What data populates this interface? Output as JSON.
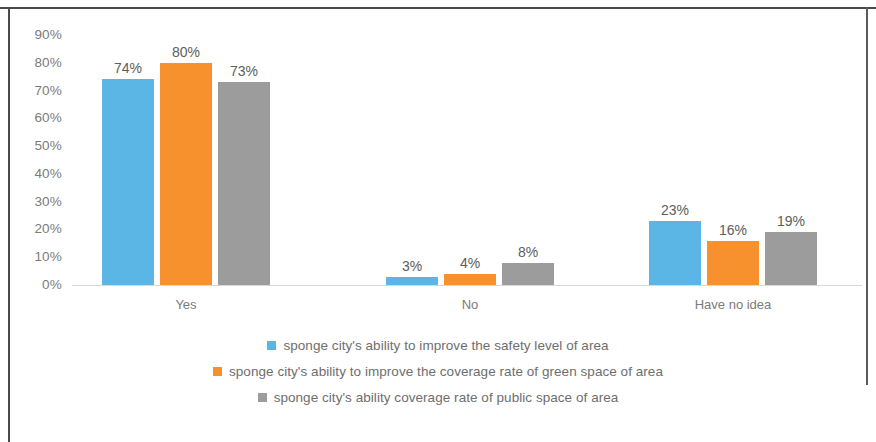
{
  "chart_data": {
    "type": "bar",
    "title": "",
    "subtitle": "",
    "xlabel": "",
    "ylabel": "",
    "categories": [
      "Yes",
      "No",
      "Have no idea"
    ],
    "series": [
      {
        "name": "sponge city's ability to improve the safety level of area",
        "color": "#5BB5E5",
        "values": [
          74,
          80,
          73
        ],
        "labels": [
          "74%",
          "3%",
          "23%"
        ],
        "values_by_category": {
          "Yes": 74,
          "No": 3,
          "Have no idea": 23
        }
      },
      {
        "name": "sponge city's ability to improve the coverage rate of green space of area",
        "color": "#F7912E",
        "values": [
          80,
          4,
          16
        ],
        "labels": [
          "80%",
          "4%",
          "16%"
        ],
        "values_by_category": {
          "Yes": 80,
          "No": 4,
          "Have no idea": 16
        }
      },
      {
        "name": "sponge city's ability coverage rate of public space of area",
        "color": "#9C9C9C",
        "values": [
          73,
          8,
          19
        ],
        "labels": [
          "73%",
          "8%",
          "19%"
        ],
        "values_by_category": {
          "Yes": 73,
          "No": 8,
          "Have no idea": 19
        }
      }
    ],
    "ylim": [
      0,
      90
    ],
    "ytick_labels": [
      "90%",
      "80%",
      "70%",
      "60%",
      "50%",
      "40%",
      "30%",
      "20%",
      "10%",
      "0%"
    ],
    "ytick_values": [
      90,
      80,
      70,
      60,
      50,
      40,
      30,
      20,
      10,
      0
    ],
    "grid": false,
    "legend_position": "bottom",
    "value_labels_shown": true
  },
  "axis": {
    "y": {
      "ticks": [
        {
          "label": "90%",
          "value": 90
        },
        {
          "label": "80%",
          "value": 80
        },
        {
          "label": "70%",
          "value": 70
        },
        {
          "label": "60%",
          "value": 60
        },
        {
          "label": "50%",
          "value": 50
        },
        {
          "label": "40%",
          "value": 40
        },
        {
          "label": "30%",
          "value": 30
        },
        {
          "label": "20%",
          "value": 20
        },
        {
          "label": "10%",
          "value": 10
        },
        {
          "label": "0%",
          "value": 0
        }
      ]
    },
    "x": {
      "categories": [
        {
          "label": "Yes"
        },
        {
          "label": "No"
        },
        {
          "label": "Have no idea"
        }
      ]
    }
  },
  "bars": {
    "group0": [
      {
        "label": "74%",
        "value": 74,
        "color": "#5BB5E5",
        "series": 0
      },
      {
        "label": "80%",
        "value": 80,
        "color": "#F7912E",
        "series": 1
      },
      {
        "label": "73%",
        "value": 73,
        "color": "#9C9C9C",
        "series": 2
      }
    ],
    "group1": [
      {
        "label": "3%",
        "value": 3,
        "color": "#5BB5E5",
        "series": 0
      },
      {
        "label": "4%",
        "value": 4,
        "color": "#F7912E",
        "series": 1
      },
      {
        "label": "8%",
        "value": 8,
        "color": "#9C9C9C",
        "series": 2
      }
    ],
    "group2": [
      {
        "label": "23%",
        "value": 23,
        "color": "#5BB5E5",
        "series": 0
      },
      {
        "label": "16%",
        "value": 16,
        "color": "#F7912E",
        "series": 1
      },
      {
        "label": "19%",
        "value": 19,
        "color": "#9C9C9C",
        "series": 2
      }
    ]
  },
  "legend": {
    "items": [
      {
        "label": "sponge city's ability to improve the safety level of area",
        "color": "#5BB5E5"
      },
      {
        "label": "sponge city's ability to improve the coverage rate of green space of area",
        "color": "#F7912E"
      },
      {
        "label": "sponge city's ability coverage rate of public space of area",
        "color": "#9C9C9C"
      }
    ]
  },
  "colors": {
    "series_blue": "#5BB5E5",
    "series_orange": "#F7912E",
    "series_gray": "#9C9C9C",
    "axis_text": "#7b7b7b",
    "label_text": "#5d5d5d",
    "baseline": "#d8d8d8",
    "frame": "#4a4a4a"
  }
}
